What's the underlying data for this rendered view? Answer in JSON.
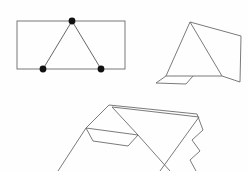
{
  "canvas": {
    "width": 248,
    "height": 171,
    "background_color": "#fefefe",
    "stroke_color": "#6b6b6b",
    "vertex_color": "#111111",
    "description": "three simple black-and-white line drawings of tent-like shapes on a white background"
  },
  "figures": [
    {
      "id": "figure-top-left",
      "name": "rectangle-with-inscribed-triangle",
      "description": "A wide rectangle with a triangle drawn inside it; the triangle apex touches the top edge and its two base vertices sit on the bottom edge. Three filled round vertex markers.",
      "rectangle": {
        "left": 17,
        "top": 21,
        "right": 125,
        "bottom": 69
      },
      "triangle_points": "72,21 43,69 101,69",
      "vertices": [
        {
          "label": "apex",
          "cx": 72,
          "cy": 21,
          "r": 3.4
        },
        {
          "label": "base-left",
          "cx": 43,
          "cy": 69,
          "r": 3.4
        },
        {
          "label": "base-right",
          "cx": 101,
          "cy": 69,
          "r": 3.4
        }
      ]
    },
    {
      "id": "figure-top-right",
      "name": "tent-with-side-panel",
      "description": "A tent-like polygon: a triangular front face with an apex, a quadrilateral side panel extending to the right, and a small folded flap at the bottom left.",
      "front_triangle": "190,22 166,76 222,76",
      "side_panel": "190,22 241,36 240,82 222,76",
      "base_line": "166,76 222,76",
      "left_flap": "166,76 156,83 186,84 193,76",
      "ground_right": "222,76 240,82"
    },
    {
      "id": "figure-bottom",
      "name": "tent-with-guy-lines-and-zigzag-edge",
      "description": "A pitched tent shape with a ridge, a triangular end panel, a small folded ground flap, two long guy lines running down to the lower corners, and a zigzag vertical edge on the right side.",
      "ridge_main": "109,105 197,114",
      "ridge_second": "112,107 199,117",
      "end_panel": "109,105 86,128 138,135 112,107",
      "left_face": "109,105 86,128",
      "flap": "86,128 93,141 128,146 138,135",
      "ridge_to_base": "112,107 138,135",
      "right_face": "199,117 160,171",
      "guy_line_left": "86,128 58,171",
      "guy_line_right": "138,135 170,171",
      "zigzag_edge": "197,114 203,130 192,140 200,151 190,160 196,171"
    }
  ]
}
